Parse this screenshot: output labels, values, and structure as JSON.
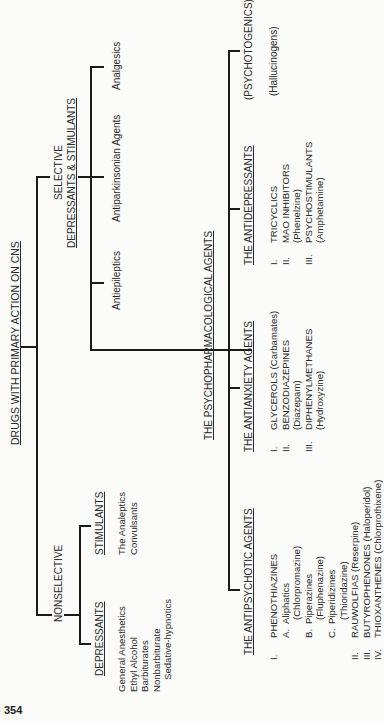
{
  "page_number": "354",
  "root": {
    "label": "DRUGS WITH PRIMARY ACTION ON CNS"
  },
  "nonselective": {
    "label": "NONSELECTIVE",
    "depressants": {
      "label": "DEPRESSANTS",
      "items": [
        "General Anesthetics",
        "Ethyl Alcohol",
        "Barbiturates",
        "Nonbarbiturate",
        "Sedative-hypnotics"
      ]
    },
    "stimulants": {
      "label": "STIMULANTS",
      "items": [
        "The Analeptics",
        "Convulsants"
      ]
    }
  },
  "selective": {
    "label_line1": "SELECTIVE",
    "label_line2": "DEPRESSANTS & STIMULANTS",
    "items": [
      "Antiepileptics",
      "Antiparkinsonian Agents",
      "Analgesics"
    ]
  },
  "psychopharmacological": {
    "label": "THE PSYCHOPHARMACOLOGICAL AGENTS",
    "antipsychotic": {
      "label": "THE ANTIPSYCHOTIC AGENTS",
      "lines": [
        {
          "num": "I.",
          "text": "PHENOTHIAZINES"
        },
        {
          "num": "",
          "sub": "A.",
          "text": "Aliphatics"
        },
        {
          "num": "",
          "sub": "",
          "text": "(Chlorpromazine)"
        },
        {
          "num": "",
          "sub": "B.",
          "text": "Piperazines"
        },
        {
          "num": "",
          "sub": "",
          "text": "(Fluphenazine)"
        },
        {
          "num": "",
          "sub": "C.",
          "text": "Piperidizines"
        },
        {
          "num": "",
          "sub": "",
          "text": "(Thioridazine)"
        },
        {
          "num": "II.",
          "text": "RAUWOLFIAS (Reserpine)"
        },
        {
          "num": "III.",
          "text": "BUTYROPHENONES (Haloperidol)"
        },
        {
          "num": "IV.",
          "text": "THIOXANTHENES (Chlorprothixene)"
        }
      ]
    },
    "antianxiety": {
      "label": "THE ANTIANXIETY AGENTS",
      "lines": [
        {
          "num": "I.",
          "text": "GLYCEROLS (Carbamates)"
        },
        {
          "num": "II.",
          "text": "BENZODIAZEPINES"
        },
        {
          "num": "",
          "text": "(Diazepam)"
        },
        {
          "num": "III.",
          "text": "DIPHENYLMETHANES"
        },
        {
          "num": "",
          "text": "(Hydroxyzine)"
        }
      ]
    },
    "antidepressants": {
      "label": "THE ANTIDEPRESSANTS",
      "lines": [
        {
          "num": "I.",
          "text": "TRICYCLICS"
        },
        {
          "num": "II.",
          "text": "MAO INHIBITORS"
        },
        {
          "num": "",
          "text": "(Phenelzine)"
        },
        {
          "num": "III.",
          "text": "PSYCHOSTIMULANTS"
        },
        {
          "num": "",
          "text": "(Amphetamine)"
        }
      ]
    },
    "psychotogenics": {
      "label": "(PSYCHOTOGENICS)",
      "sub": "(Hallucinogens)"
    }
  }
}
